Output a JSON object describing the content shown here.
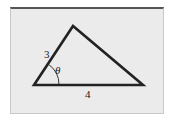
{
  "diagram": {
    "type": "triangle",
    "vertices": {
      "left": [
        34,
        85
      ],
      "top": [
        73,
        26
      ],
      "right": [
        143,
        85
      ]
    },
    "labels": {
      "side_left": "3",
      "side_bottom": "4",
      "angle": "θ"
    },
    "colors": {
      "stroke": "#222222",
      "background": "#ebebeb"
    }
  }
}
